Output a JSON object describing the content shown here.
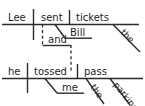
{
  "diagram": {
    "type": "reed-kellogg-sentence-diagram",
    "sentence": "Lee sent Bill tickets and he tossed me the parking pass",
    "ink_color": "#2b2b2b",
    "text_color": "#1e1e1e",
    "background_color": "#ffffff",
    "clauses": [
      {
        "id": "clause-top",
        "subject": "Lee",
        "verb": "sent",
        "direct_object": "tickets",
        "indirect_object": "Bill",
        "modifiers": [
          {
            "word": "the",
            "modifies": "tickets",
            "slant": "diagonal"
          }
        ]
      },
      {
        "id": "clause-bottom",
        "subject": "he",
        "verb": "tossed",
        "direct_object": "pass",
        "indirect_object": "me",
        "modifiers": [
          {
            "word": "the",
            "modifies": "pass",
            "slant": "diagonal"
          },
          {
            "word": "parking",
            "modifies": "pass",
            "slant": "diagonal"
          }
        ]
      }
    ],
    "conjunction": {
      "word": "and",
      "connector": "dashed",
      "joins": [
        "clause-top",
        "clause-bottom"
      ]
    },
    "labels": {
      "lee": "Lee",
      "sent": "sent",
      "tickets": "tickets",
      "bill": "Bill",
      "the_top": "the",
      "and": "and",
      "he": "he",
      "tossed": "tossed",
      "pass": "pass",
      "me": "me",
      "the_bottom": "the",
      "parking": "parking"
    }
  }
}
